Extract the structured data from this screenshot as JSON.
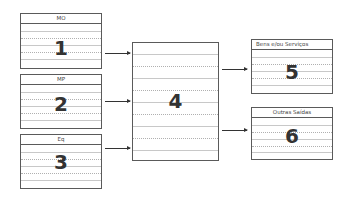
{
  "diagram": {
    "inputs": [
      {
        "label": "MO",
        "number": "1"
      },
      {
        "label": "MP",
        "number": "2"
      },
      {
        "label": "Eq",
        "number": "3"
      }
    ],
    "process": {
      "number": "4"
    },
    "outputs": [
      {
        "label": "Bens e/ou Serviços",
        "number": "5"
      },
      {
        "label": "Outras Saídas",
        "number": "6"
      }
    ],
    "colors": {
      "border": "#5a5a5a",
      "text": "#333333",
      "rules": "#c8c8c8"
    }
  }
}
